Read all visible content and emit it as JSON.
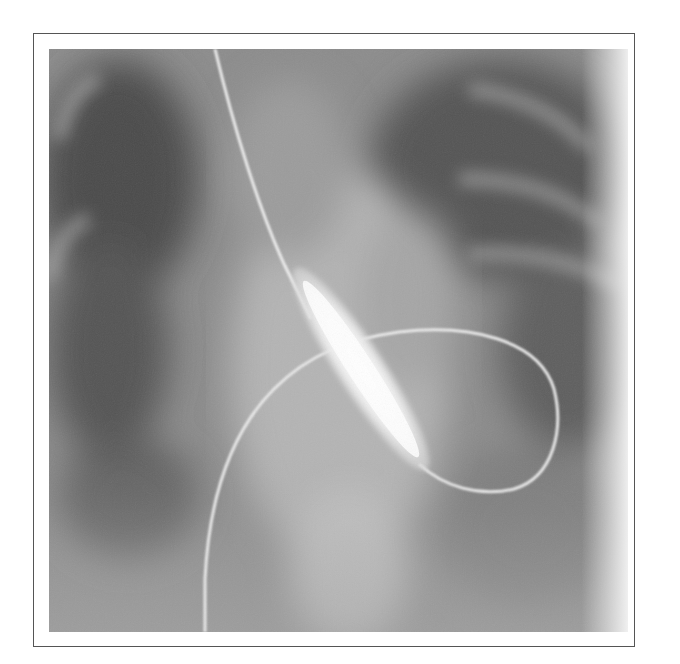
{
  "figure": {
    "type": "fluoroscopy-image",
    "frame_color": "#555555",
    "background_color": "#ffffff",
    "tones": {
      "dark_lung": "#4a4a4a",
      "mid_soft_tissue": "#8a8a8a",
      "bright_mediastinum": "#c4c4c4",
      "wire": "#f2f2f2",
      "balloon": "#f7f7f7"
    }
  }
}
